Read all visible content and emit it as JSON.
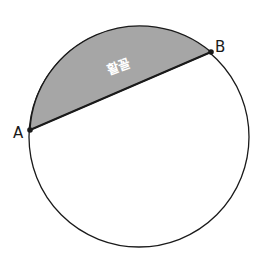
{
  "diagram": {
    "type": "circle-segment",
    "circle": {
      "cx": 139,
      "cy": 137,
      "r": 110
    },
    "points": [
      {
        "id": "A",
        "label": "A",
        "x": 30,
        "y": 130
      },
      {
        "id": "B",
        "label": "B",
        "x": 211,
        "y": 52
      }
    ],
    "chord": {
      "from": "A",
      "to": "B"
    },
    "segment": {
      "label": "활꼴",
      "fill": "#a6a6a6"
    },
    "colors": {
      "stroke": "#1a1a1a",
      "segment_fill": "#a6a6a6",
      "background": "#ffffff"
    }
  }
}
